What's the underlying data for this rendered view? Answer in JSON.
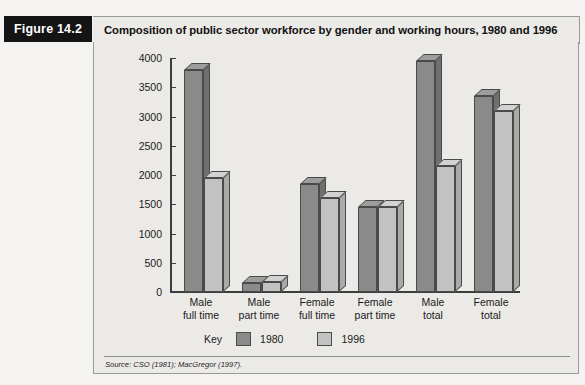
{
  "figure": {
    "tag": "Figure 14.2",
    "title": "Composition of public sector workforce by gender and working hours, 1980 and 1996",
    "source": "Source: CSO (1981); MacGregor (1997)."
  },
  "legend": {
    "key_label": "Key",
    "entries": [
      {
        "label": "1980",
        "color": "#8a8a8a"
      },
      {
        "label": "1996",
        "color": "#c2c2c2"
      }
    ]
  },
  "chart_data": {
    "type": "bar",
    "title": "Composition of public sector workforce by gender and working hours, 1980 and 1996",
    "xlabel": "",
    "ylabel": "",
    "ylim": [
      0,
      4000
    ],
    "yticks": [
      0,
      500,
      1000,
      1500,
      2000,
      2500,
      3000,
      3500,
      4000
    ],
    "ytick_labels": [
      "0",
      "500",
      "1000",
      "1500",
      "2000",
      "2500",
      "3000",
      "3500",
      "4000"
    ],
    "grid": false,
    "legend_position": "bottom-left",
    "categories": [
      "Male full time",
      "Male part time",
      "Female full time",
      "Female part time",
      "Male total",
      "Female total"
    ],
    "category_lines": [
      [
        "Male",
        "full time"
      ],
      [
        "Male",
        "part time"
      ],
      [
        "Female",
        "full time"
      ],
      [
        "Female",
        "part time"
      ],
      [
        "Male",
        "total"
      ],
      [
        "Female",
        "total"
      ]
    ],
    "series": [
      {
        "name": "1980",
        "color": "#8a8a8a",
        "values": [
          3800,
          150,
          1850,
          1450,
          3950,
          3350
        ]
      },
      {
        "name": "1996",
        "color": "#c2c2c2",
        "values": [
          1950,
          170,
          1600,
          1450,
          2150,
          3100
        ]
      }
    ]
  }
}
